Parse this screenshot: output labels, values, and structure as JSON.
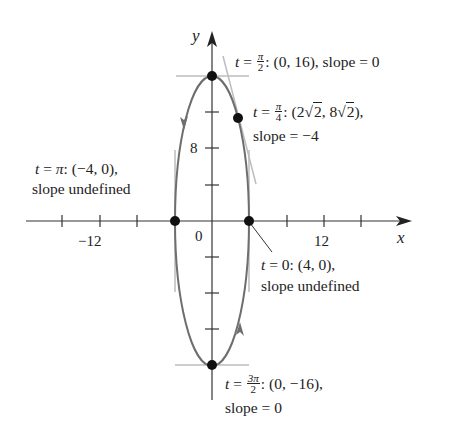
{
  "figure": {
    "type": "parametric-ellipse-plot",
    "colors": {
      "curve": "#6e6e6e",
      "tangent": "#bdbdbd",
      "axis": "#333333",
      "point": "#111111",
      "text": "#222222"
    },
    "axes": {
      "x_label": "x",
      "y_label": "y",
      "origin_label": "0",
      "x_tick_labels": [
        {
          "value": -12,
          "text": "−12"
        },
        {
          "value": 12,
          "text": "12"
        }
      ],
      "y_tick_labels": [
        {
          "value": 8,
          "text": "8"
        }
      ],
      "x_ticks": [
        -16,
        -12,
        -8,
        -4,
        4,
        8,
        12,
        16
      ],
      "y_ticks": [
        -12,
        -8,
        -4,
        4,
        8,
        12
      ]
    },
    "curve": {
      "equation_x": "4cos t",
      "equation_y": "16sin t",
      "direction": "counterclockwise"
    },
    "points": [
      {
        "t": "π/2",
        "x": 0,
        "y": 16,
        "label_t": "t",
        "label_eq": " = ",
        "label_frac_num": "π",
        "label_frac_den": "2",
        "label_coords": ": (0, 16), slope = 0",
        "slope": "0"
      },
      {
        "t": "π/4",
        "x": 2.828,
        "y": 11.314,
        "label_t": "t",
        "label_eq": " = ",
        "label_frac_num": "π",
        "label_frac_den": "4",
        "label_coords_a": ": (2",
        "label_sqrt_a": "2",
        "label_coords_b": ", 8",
        "label_sqrt_b": "2",
        "label_coords_c": "),",
        "label_line2": "slope = −4",
        "slope": "-4"
      },
      {
        "t": "π",
        "x": -4,
        "y": 0,
        "label_t": "t",
        "label_eq": " = ",
        "label_pi": "π",
        "label_coords": ": (−4, 0),",
        "label_line2": "slope undefined",
        "slope": "undefined"
      },
      {
        "t": "0",
        "x": 4,
        "y": 0,
        "label_t": "t",
        "label_coords": " = 0: (4, 0),",
        "label_line2": "slope undefined",
        "slope": "undefined"
      },
      {
        "t": "3π/2",
        "x": 0,
        "y": -16,
        "label_t": "t",
        "label_eq": " = ",
        "label_frac_num": "3π",
        "label_frac_den": "2",
        "label_coords": ": (0, −16),",
        "label_line2": "slope = 0",
        "slope": "0"
      }
    ]
  }
}
